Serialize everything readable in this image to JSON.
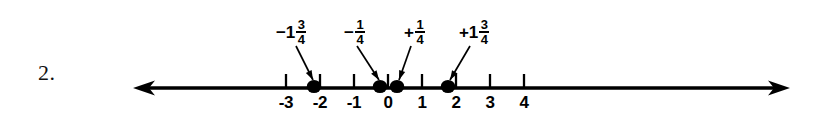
{
  "figure": {
    "problem_number": "2.",
    "background_color": "#ffffff",
    "ink_color": "#000000"
  },
  "number_line": {
    "axis_y": 88,
    "left_arrow_tip_x": 133,
    "right_arrow_tip_x": 790,
    "unit_px": 34,
    "zero_x": 388,
    "tick_labels": [
      "-3",
      "-2",
      "-1",
      "0",
      "1",
      "2",
      "3",
      "4"
    ],
    "tick_values": [
      -3,
      -2,
      -1,
      0,
      1,
      2,
      3,
      4
    ],
    "tick_label_y": 94
  },
  "points": [
    {
      "id": "point-neg-1-3-4",
      "value": -1.75,
      "dot_x": 314,
      "label": {
        "sign_int": "−1",
        "numerator": "3",
        "denominator": "4",
        "x": 276,
        "y": 18
      },
      "leader": {
        "x1": 296,
        "y1": 46,
        "x2": 313,
        "y2": 80
      }
    },
    {
      "id": "point-neg-1-4",
      "value": -0.25,
      "dot_x": 380,
      "label": {
        "sign_int": "−",
        "numerator": "1",
        "denominator": "4",
        "x": 344,
        "y": 18
      },
      "leader": {
        "x1": 357,
        "y1": 46,
        "x2": 379,
        "y2": 80
      }
    },
    {
      "id": "point-pos-1-4",
      "value": 0.25,
      "dot_x": 397,
      "label": {
        "sign_int": "+",
        "numerator": "1",
        "denominator": "4",
        "x": 404,
        "y": 18
      },
      "leader": {
        "x1": 411,
        "y1": 46,
        "x2": 399,
        "y2": 80
      }
    },
    {
      "id": "point-pos-1-3-4",
      "value": 1.75,
      "dot_x": 448,
      "label": {
        "sign_int": "+1",
        "numerator": "3",
        "denominator": "4",
        "x": 459,
        "y": 18
      },
      "leader": {
        "x1": 470,
        "y1": 46,
        "x2": 450,
        "y2": 80
      }
    }
  ]
}
